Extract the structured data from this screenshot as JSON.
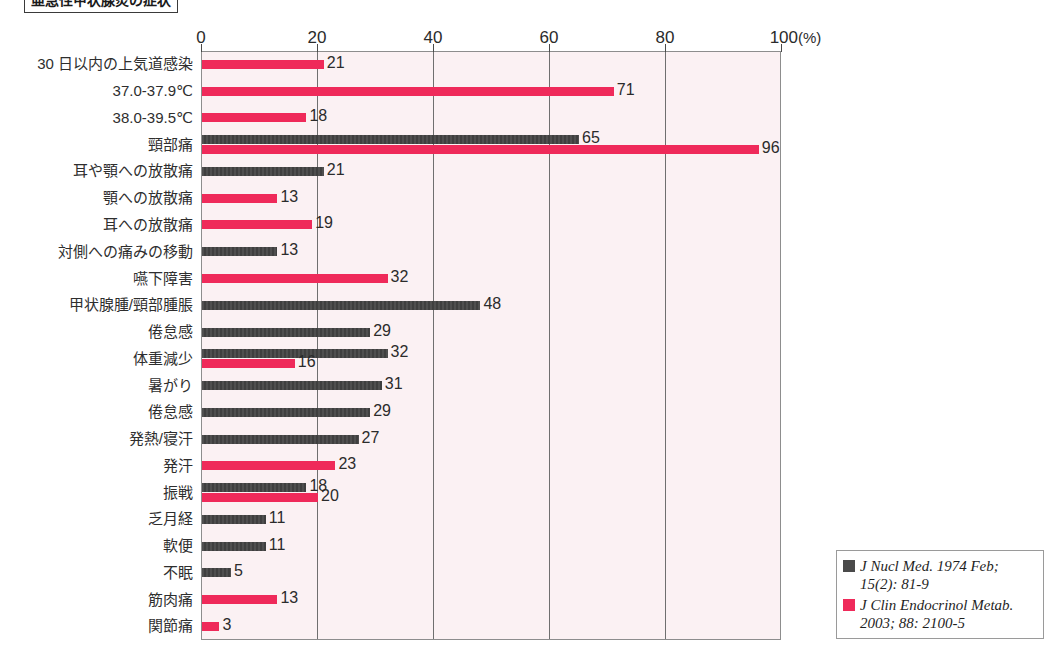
{
  "title": "亜急性甲状腺炎の症状",
  "chart_data": {
    "type": "bar",
    "orientation": "horizontal",
    "title": "亜急性甲状腺炎の症状",
    "xlabel": "(%)",
    "ylabel": "",
    "xlim": [
      0,
      100
    ],
    "xticks": [
      0,
      20,
      40,
      60,
      80,
      100
    ],
    "xtick_labels": [
      "0",
      "20",
      "40",
      "60",
      "80",
      "100"
    ],
    "x_unit_label": "(%)",
    "grid": "vertical",
    "legend_position": "outside-bottom-right",
    "colors": {
      "series_dark": "#4a4a4a",
      "series_pink": "#ef2a5a",
      "plot_background": "#fbf1f3",
      "plot_border": "#8d8d8d",
      "gridline": "#6f6f6f"
    },
    "series": [
      {
        "name": "J Nucl Med. 1974 Feb; 15(2): 81-9",
        "color": "#4a4a4a",
        "swatch": "dark"
      },
      {
        "name": "J Clin Endocrinol Metab. 2003; 88: 2100-5",
        "color": "#ef2a5a",
        "swatch": "pink"
      }
    ],
    "categories": [
      "30 日以内の上気道感染",
      "37.0-37.9℃",
      "38.0-39.5℃",
      "頸部痛",
      "耳や顎への放散痛",
      "顎への放散痛",
      "耳への放散痛",
      "対側への痛みの移動",
      "嚥下障害",
      "甲状腺腫/頸部腫脹",
      "倦怠感",
      "体重減少",
      "暑がり",
      "倦怠感",
      "発熱/寝汗",
      "発汗",
      "振戦",
      "乏月経",
      "軟便",
      "不眠",
      "筋肉痛",
      "関節痛"
    ],
    "rows": [
      {
        "label": "30 日以内の上気道感染",
        "bars": [
          {
            "series": "pink",
            "value": 21
          }
        ]
      },
      {
        "label": "37.0-37.9℃",
        "bars": [
          {
            "series": "pink",
            "value": 71
          }
        ]
      },
      {
        "label": "38.0-39.5℃",
        "bars": [
          {
            "series": "pink",
            "value": 18
          }
        ]
      },
      {
        "label": "頸部痛",
        "bars": [
          {
            "series": "dark",
            "value": 65
          },
          {
            "series": "pink",
            "value": 96
          }
        ]
      },
      {
        "label": "耳や顎への放散痛",
        "bars": [
          {
            "series": "dark",
            "value": 21
          }
        ]
      },
      {
        "label": "顎への放散痛",
        "bars": [
          {
            "series": "pink",
            "value": 13
          }
        ]
      },
      {
        "label": "耳への放散痛",
        "bars": [
          {
            "series": "pink",
            "value": 19
          }
        ]
      },
      {
        "label": "対側への痛みの移動",
        "bars": [
          {
            "series": "dark",
            "value": 13
          }
        ]
      },
      {
        "label": "嚥下障害",
        "bars": [
          {
            "series": "pink",
            "value": 32
          }
        ]
      },
      {
        "label": "甲状腺腫/頸部腫脹",
        "bars": [
          {
            "series": "dark",
            "value": 48
          }
        ]
      },
      {
        "label": "倦怠感",
        "bars": [
          {
            "series": "dark",
            "value": 29
          }
        ]
      },
      {
        "label": "体重減少",
        "bars": [
          {
            "series": "dark",
            "value": 32
          },
          {
            "series": "pink",
            "value": 16
          }
        ]
      },
      {
        "label": "暑がり",
        "bars": [
          {
            "series": "dark",
            "value": 31
          }
        ]
      },
      {
        "label": "倦怠感",
        "bars": [
          {
            "series": "dark",
            "value": 29
          }
        ]
      },
      {
        "label": "発熱/寝汗",
        "bars": [
          {
            "series": "dark",
            "value": 27
          }
        ]
      },
      {
        "label": "発汗",
        "bars": [
          {
            "series": "pink",
            "value": 23
          }
        ]
      },
      {
        "label": "振戦",
        "bars": [
          {
            "series": "dark",
            "value": 18
          },
          {
            "series": "pink",
            "value": 20
          }
        ]
      },
      {
        "label": "乏月経",
        "bars": [
          {
            "series": "dark",
            "value": 11
          }
        ]
      },
      {
        "label": "軟便",
        "bars": [
          {
            "series": "dark",
            "value": 11
          }
        ]
      },
      {
        "label": "不眠",
        "bars": [
          {
            "series": "dark",
            "value": 5
          }
        ]
      },
      {
        "label": "筋肉痛",
        "bars": [
          {
            "series": "pink",
            "value": 13
          }
        ]
      },
      {
        "label": "関節痛",
        "bars": [
          {
            "series": "pink",
            "value": 3
          }
        ]
      }
    ]
  },
  "legend": {
    "items": [
      {
        "swatch": "dark",
        "line1": "J Nucl Med. 1974 Feb;",
        "line2": "15(2): 81-9"
      },
      {
        "swatch": "pink",
        "line1": "J Clin Endocrinol Metab.",
        "line2": "2003; 88: 2100-5"
      }
    ]
  }
}
